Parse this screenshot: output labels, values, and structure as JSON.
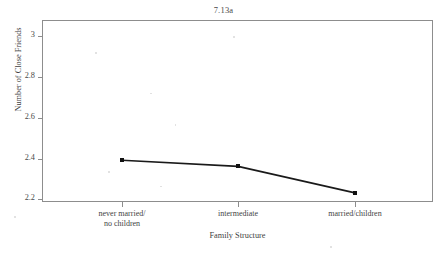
{
  "chart_data": {
    "type": "line",
    "title": "7.13a",
    "xlabel": "Family Structure",
    "ylabel": "Number of Close Friends",
    "categories": [
      "never married/\nno children",
      "intermediate",
      "married/children"
    ],
    "category_lines": [
      [
        "never married/",
        "no children"
      ],
      [
        "intermediate",
        ""
      ],
      [
        "married/children",
        ""
      ]
    ],
    "values": [
      2.39,
      2.36,
      2.23
    ],
    "ylim": [
      2.17,
      3.02
    ],
    "yticks": [
      3,
      2.8,
      2.6,
      2.4,
      2.2
    ],
    "ytick_labels": [
      "3",
      "2.8",
      "2.6",
      "2.4",
      "2.2"
    ],
    "grid": false,
    "legend": "none",
    "series": [
      {
        "name": "Number of Close Friends",
        "values": [
          2.39,
          2.36,
          2.23
        ],
        "marker": "square",
        "color": "#111111"
      }
    ]
  },
  "colors": {
    "line": "#1a1a1a",
    "marker": "#111111",
    "frame": "#8d8d8d",
    "text": "#3f3f3f",
    "background": "#ffffff"
  }
}
